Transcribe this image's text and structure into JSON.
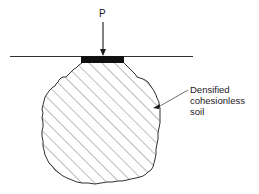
{
  "diagram": {
    "load_label": "P",
    "callout_lines": [
      "Densified",
      "cohesionless",
      "soil"
    ],
    "colors": {
      "ink": "#1a1a1a",
      "hatch": "#555555",
      "background": "#ffffff"
    }
  }
}
